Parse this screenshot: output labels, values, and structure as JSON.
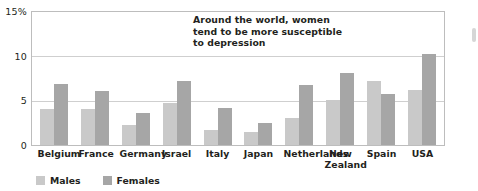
{
  "chart_data": {
    "type": "bar",
    "title": "",
    "xlabel": "",
    "ylabel": "",
    "ylim": [
      0,
      15
    ],
    "yticks": [
      0,
      5,
      10,
      15
    ],
    "ytick_labels": [
      "0",
      "5",
      "10",
      "15%"
    ],
    "grid": true,
    "legend_position": "bottom-left",
    "categories": [
      "Belgium",
      "France",
      "Germany",
      "Israel",
      "Italy",
      "Japan",
      "Netherlands",
      "New Zealand",
      "Spain",
      "USA"
    ],
    "series": [
      {
        "name": "Males",
        "color": "#c9c9c9",
        "values": [
          4.0,
          4.0,
          2.2,
          4.7,
          1.7,
          1.5,
          3.0,
          5.0,
          7.2,
          6.2
        ]
      },
      {
        "name": "Females",
        "color": "#a6a6a6",
        "values": [
          6.8,
          6.0,
          3.6,
          7.2,
          4.1,
          2.5,
          6.7,
          8.1,
          5.7,
          10.2
        ]
      }
    ],
    "annotations": [
      {
        "text": "Around the world, women tend to be more susceptible to depression",
        "lines": [
          "Around the world, women",
          "tend to be more susceptible",
          "to depression"
        ]
      }
    ]
  },
  "axis": {
    "y_tick_0": "0",
    "y_tick_1": "5",
    "y_tick_2": "10",
    "y_tick_3": "15%"
  },
  "annotation": {
    "line1": "Around the world, women",
    "line2": "tend to be more susceptible",
    "line3": "to depression"
  },
  "legend": {
    "males_label": "Males",
    "females_label": "Females"
  },
  "x_labels": {
    "belgium": "Belgium",
    "france": "France",
    "germany": "Germany",
    "israel": "Israel",
    "italy": "Italy",
    "japan": "Japan",
    "netherlands": "Netherlands",
    "new_zealand_line1": "New",
    "new_zealand_line2": "Zealand",
    "spain": "Spain",
    "usa": "USA"
  }
}
